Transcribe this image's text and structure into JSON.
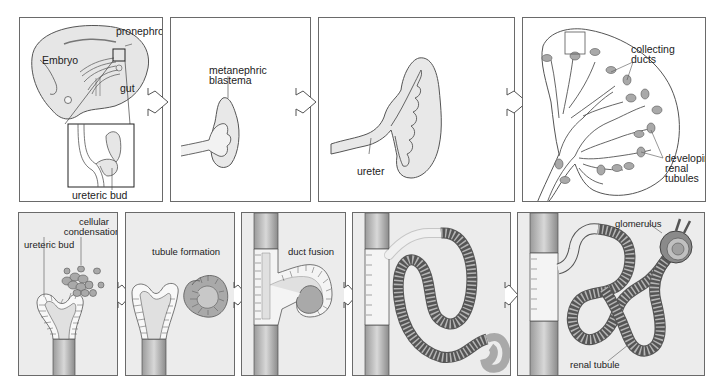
{
  "figure": {
    "top_row": [
      {
        "id": "embryo",
        "labels": {
          "embryo": "Embryo",
          "pronephros": "pronephros",
          "gut": "gut",
          "ureteric_bud": "ureteric bud"
        }
      },
      {
        "id": "metanephric",
        "labels": {
          "metanephric_line1": "metanephric",
          "metanephric_line2": "blastema"
        }
      },
      {
        "id": "ureter",
        "labels": {
          "ureter": "ureter"
        }
      },
      {
        "id": "collecting",
        "labels": {
          "collecting_line1": "collecting",
          "collecting_line2": "ducts",
          "developing_line1": "developing",
          "developing_line2": "renal",
          "developing_line3": "tubules"
        }
      }
    ],
    "bottom_row": [
      {
        "id": "condensation",
        "labels": {
          "ureteric_bud": "ureteric bud",
          "cellular_line1": "cellular",
          "cellular_line2": "condensation"
        }
      },
      {
        "id": "tubule",
        "labels": {
          "tubule_formation": "tubule formation"
        }
      },
      {
        "id": "fusion",
        "labels": {
          "duct_fusion": "duct fusion"
        }
      },
      {
        "id": "elongation",
        "labels": {}
      },
      {
        "id": "mature",
        "labels": {
          "glomerulus": "glomerulus",
          "renal_tubule": "renal tubule"
        }
      }
    ],
    "colors": {
      "outline": "#555555",
      "tissue_fill": "#e8e8e8",
      "cell_fill": "#a9a9a9",
      "panel_shade": "#ececec",
      "text": "#222222"
    },
    "arrow_icon": "right-chevron-arrow"
  }
}
